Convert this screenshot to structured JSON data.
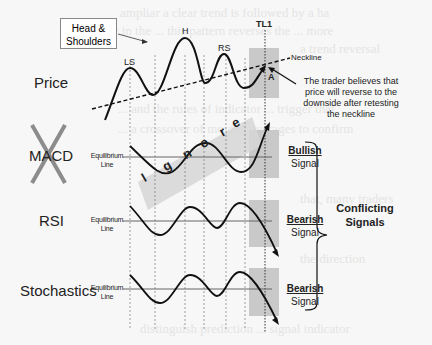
{
  "diagram": {
    "pattern_box": "Head & Shoulders",
    "peaks": {
      "left_shoulder": "LS",
      "head": "H",
      "right_shoulder": "RS"
    },
    "time_marker": "TL1",
    "neckline_label": "Neckline",
    "area_label": "A",
    "annotation": "The trader believes that price will reverse to the downside after retesting the neckline",
    "annotation_lines": [
      "The trader believes that",
      "price will reverse to the",
      "downside after retesting",
      "the neckline"
    ],
    "panels": [
      {
        "name": "Price",
        "crossed_out": false
      },
      {
        "name": "MACD",
        "crossed_out": true,
        "overlay_text": "Ignore",
        "equilibrium": [
          "Equilibrium",
          "Line"
        ],
        "signal": {
          "type": "Bullish",
          "word": "Signal"
        }
      },
      {
        "name": "RSI",
        "crossed_out": false,
        "equilibrium": [
          "Equilibrium",
          "Line"
        ],
        "signal": {
          "type": "Bearish",
          "word": "Signal"
        }
      },
      {
        "name": "Stochastics",
        "crossed_out": false,
        "equilibrium": [
          "Equilibrium",
          "Line"
        ],
        "signal": {
          "type": "Bearish",
          "word": "Signal"
        }
      }
    ],
    "bracket_label": [
      "Conflicting",
      "Signals"
    ],
    "ignore_letters": [
      "I",
      "g",
      "n",
      "o",
      "r",
      "e"
    ],
    "colors": {
      "line": "#111111",
      "box": "#c9c9c9",
      "cross": "#8c8c8c",
      "ignore_band": "#d6d6d6",
      "equilibrium": "#666666"
    }
  }
}
